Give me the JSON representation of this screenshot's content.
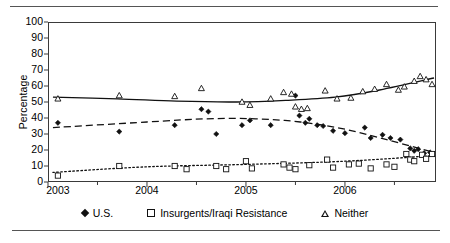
{
  "figure": {
    "has_top_rule": true,
    "has_bottom_rule": true,
    "rule_color": "#555555"
  },
  "chart_data": {
    "type": "scatter",
    "title": "",
    "subtitle": "",
    "xlabel": "",
    "ylabel": "Percentage",
    "xlim": [
      2003.0,
      2006.92
    ],
    "ylim": [
      0,
      100
    ],
    "ytick_labels": [
      "0",
      "10",
      "20",
      "30",
      "40",
      "50",
      "60",
      "70",
      "80",
      "90",
      "100"
    ],
    "ytick_values": [
      0,
      10,
      20,
      30,
      40,
      50,
      60,
      70,
      80,
      90,
      100
    ],
    "xtick_labels": [
      "2003",
      "2004",
      "2005",
      "2006"
    ],
    "xtick_values": [
      2003.1,
      2004.0,
      2005.0,
      2006.0
    ],
    "grid": false,
    "legend_position": "below-plot",
    "series": [
      {
        "name": "U.S.",
        "marker": "filled-diamond",
        "color": "#111111",
        "trend_style": "dashed",
        "points": [
          {
            "x": 2003.1,
            "y": 37.0
          },
          {
            "x": 2003.72,
            "y": 31.5
          },
          {
            "x": 2004.28,
            "y": 35.5
          },
          {
            "x": 2004.55,
            "y": 45.5
          },
          {
            "x": 2004.62,
            "y": 44.0
          },
          {
            "x": 2004.7,
            "y": 30.0
          },
          {
            "x": 2004.96,
            "y": 35.5
          },
          {
            "x": 2005.04,
            "y": 38.5
          },
          {
            "x": 2005.25,
            "y": 35.5
          },
          {
            "x": 2005.5,
            "y": 54.0
          },
          {
            "x": 2005.54,
            "y": 41.5
          },
          {
            "x": 2005.6,
            "y": 37.0
          },
          {
            "x": 2005.64,
            "y": 39.5
          },
          {
            "x": 2005.72,
            "y": 35.5
          },
          {
            "x": 2005.78,
            "y": 35.0
          },
          {
            "x": 2005.88,
            "y": 32.0
          },
          {
            "x": 2006.0,
            "y": 30.5
          },
          {
            "x": 2006.2,
            "y": 34.0
          },
          {
            "x": 2006.26,
            "y": 27.5
          },
          {
            "x": 2006.38,
            "y": 29.5
          },
          {
            "x": 2006.46,
            "y": 27.5
          },
          {
            "x": 2006.56,
            "y": 26.5
          },
          {
            "x": 2006.66,
            "y": 21.0
          },
          {
            "x": 2006.7,
            "y": 19.5
          },
          {
            "x": 2006.74,
            "y": 20.5
          },
          {
            "x": 2006.8,
            "y": 18.0
          },
          {
            "x": 2006.86,
            "y": 18.5
          }
        ],
        "trend": [
          {
            "x": 2003.05,
            "y": 34.0
          },
          {
            "x": 2004.0,
            "y": 37.5
          },
          {
            "x": 2004.6,
            "y": 39.5
          },
          {
            "x": 2005.1,
            "y": 39.5
          },
          {
            "x": 2005.55,
            "y": 37.5
          },
          {
            "x": 2006.0,
            "y": 33.0
          },
          {
            "x": 2006.45,
            "y": 26.0
          },
          {
            "x": 2006.9,
            "y": 18.5
          }
        ]
      },
      {
        "name": "Insurgents/Iraqi Resistance",
        "marker": "open-square",
        "color": "#111111",
        "trend_style": "dotted",
        "points": [
          {
            "x": 2003.1,
            "y": 4.0
          },
          {
            "x": 2003.72,
            "y": 10.0
          },
          {
            "x": 2004.28,
            "y": 10.0
          },
          {
            "x": 2004.4,
            "y": 8.0
          },
          {
            "x": 2004.7,
            "y": 10.0
          },
          {
            "x": 2004.8,
            "y": 8.0
          },
          {
            "x": 2005.0,
            "y": 13.0
          },
          {
            "x": 2005.06,
            "y": 8.5
          },
          {
            "x": 2005.38,
            "y": 11.0
          },
          {
            "x": 2005.44,
            "y": 9.0
          },
          {
            "x": 2005.5,
            "y": 8.0
          },
          {
            "x": 2005.64,
            "y": 10.5
          },
          {
            "x": 2005.82,
            "y": 14.0
          },
          {
            "x": 2005.88,
            "y": 9.0
          },
          {
            "x": 2006.04,
            "y": 11.0
          },
          {
            "x": 2006.14,
            "y": 11.5
          },
          {
            "x": 2006.26,
            "y": 8.5
          },
          {
            "x": 2006.42,
            "y": 11.0
          },
          {
            "x": 2006.5,
            "y": 9.5
          },
          {
            "x": 2006.62,
            "y": 17.5
          },
          {
            "x": 2006.66,
            "y": 14.0
          },
          {
            "x": 2006.7,
            "y": 13.0
          },
          {
            "x": 2006.78,
            "y": 17.0
          },
          {
            "x": 2006.82,
            "y": 14.5
          },
          {
            "x": 2006.88,
            "y": 17.5
          }
        ],
        "trend": [
          {
            "x": 2003.05,
            "y": 6.0
          },
          {
            "x": 2004.0,
            "y": 9.5
          },
          {
            "x": 2005.0,
            "y": 11.0
          },
          {
            "x": 2006.0,
            "y": 13.0
          },
          {
            "x": 2006.9,
            "y": 16.5
          }
        ]
      },
      {
        "name": "Neither",
        "marker": "open-triangle",
        "color": "#111111",
        "trend_style": "solid",
        "points": [
          {
            "x": 2003.1,
            "y": 52.0
          },
          {
            "x": 2003.72,
            "y": 54.0
          },
          {
            "x": 2004.28,
            "y": 53.5
          },
          {
            "x": 2004.55,
            "y": 58.5
          },
          {
            "x": 2004.96,
            "y": 50.0
          },
          {
            "x": 2005.04,
            "y": 48.0
          },
          {
            "x": 2005.25,
            "y": 52.0
          },
          {
            "x": 2005.38,
            "y": 56.0
          },
          {
            "x": 2005.46,
            "y": 55.0
          },
          {
            "x": 2005.5,
            "y": 47.0
          },
          {
            "x": 2005.56,
            "y": 45.5
          },
          {
            "x": 2005.62,
            "y": 46.0
          },
          {
            "x": 2005.8,
            "y": 57.0
          },
          {
            "x": 2005.92,
            "y": 52.0
          },
          {
            "x": 2006.06,
            "y": 52.5
          },
          {
            "x": 2006.18,
            "y": 56.5
          },
          {
            "x": 2006.3,
            "y": 58.0
          },
          {
            "x": 2006.42,
            "y": 61.0
          },
          {
            "x": 2006.54,
            "y": 57.5
          },
          {
            "x": 2006.6,
            "y": 59.5
          },
          {
            "x": 2006.7,
            "y": 63.0
          },
          {
            "x": 2006.76,
            "y": 66.0
          },
          {
            "x": 2006.82,
            "y": 64.0
          },
          {
            "x": 2006.88,
            "y": 61.0
          }
        ],
        "trend": [
          {
            "x": 2003.05,
            "y": 53.0
          },
          {
            "x": 2003.7,
            "y": 52.0
          },
          {
            "x": 2004.3,
            "y": 50.5
          },
          {
            "x": 2004.9,
            "y": 50.0
          },
          {
            "x": 2005.4,
            "y": 51.0
          },
          {
            "x": 2005.9,
            "y": 53.0
          },
          {
            "x": 2006.35,
            "y": 57.5
          },
          {
            "x": 2006.9,
            "y": 65.0
          }
        ]
      }
    ]
  },
  "legend": {
    "items": [
      {
        "label": "U.S.",
        "marker": "filled-diamond"
      },
      {
        "label": "Insurgents/Iraqi Resistance",
        "marker": "open-square"
      },
      {
        "label": "Neither",
        "marker": "open-triangle"
      }
    ]
  }
}
